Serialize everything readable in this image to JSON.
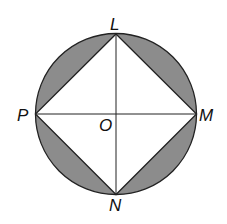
{
  "diagram": {
    "labels": {
      "top": "L",
      "right": "M",
      "bottom": "N",
      "left": "P",
      "center": "O"
    },
    "colors": {
      "shaded": "#8c8c8c",
      "stroke": "#222222",
      "fill": "#ffffff"
    }
  }
}
